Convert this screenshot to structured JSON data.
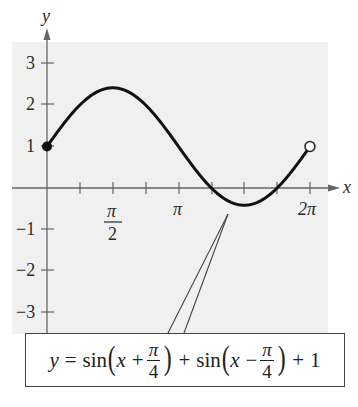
{
  "chart_data": {
    "type": "line",
    "title": "",
    "xlabel": "x",
    "ylabel": "y",
    "function": "y = sin(x + π/4) + sin(x − π/4) + 1",
    "simplified": "y = √2·sin(x) + 1",
    "domain": [
      0,
      6.2832
    ],
    "xlim": [
      -0.3,
      6.8
    ],
    "ylim": [
      -3.5,
      3.6
    ],
    "grid": false,
    "x_ticks": [
      0.7854,
      1.5708,
      2.3562,
      3.1416,
      3.927,
      4.7124,
      5.4978,
      6.2832
    ],
    "x_tick_labels": [
      {
        "value": 1.5708,
        "label": "π/2"
      },
      {
        "value": 3.1416,
        "label": "π"
      },
      {
        "value": 6.2832,
        "label": "2π"
      }
    ],
    "y_ticks": [
      -3,
      -2,
      -1,
      1,
      2,
      3
    ],
    "y_tick_labels": [
      "-3",
      "-2",
      "-1",
      "1",
      "2",
      "3"
    ],
    "points": {
      "x": [
        0,
        0.7854,
        1.5708,
        2.3562,
        3.1416,
        3.927,
        4.7124,
        5.4978,
        6.2832
      ],
      "y": [
        1,
        2.0,
        2.414,
        2.0,
        1,
        0.0,
        -0.414,
        0.0,
        1
      ]
    },
    "endpoints": [
      {
        "x": 0,
        "y": 1,
        "style": "closed"
      },
      {
        "x": 6.2832,
        "y": 1,
        "style": "open"
      }
    ],
    "annotation": {
      "label": "y = sin(x + π/4) + sin(x − π/4) + 1",
      "points_to": {
        "x": 4.4,
        "y": -0.35
      }
    }
  },
  "axes": {
    "x_label": "x",
    "y_label": "y",
    "y_tick_labels": [
      "3",
      "2",
      "1",
      "−1",
      "−2",
      "−3"
    ],
    "x_tick_labels": {
      "pi_over_2_num": "π",
      "pi_over_2_den": "2",
      "pi": "π",
      "two_pi": "2π"
    }
  },
  "equation": {
    "y": "y",
    "eq": "=",
    "sin1": "sin",
    "x1": "x",
    "plus1": "+",
    "pi1": "π",
    "den1": "4",
    "plus_mid": "+",
    "sin2": "sin",
    "x2": "x",
    "minus": "−",
    "pi2": "π",
    "den2": "4",
    "plus_end": "+",
    "one": "1",
    "lparen": "(",
    "rparen": ")"
  },
  "colors": {
    "background_panel": "#efefef",
    "curve": "#111111",
    "axis": "#666666"
  }
}
